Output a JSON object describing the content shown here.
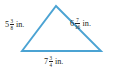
{
  "figure": {
    "type": "triangle-with-side-labels",
    "background_color": "#ffffff",
    "stroke_color": "#4ba3d3",
    "text_color": "#231f20",
    "stroke_width": 1.9,
    "vertices": {
      "apex": {
        "x": 56,
        "y": 6
      },
      "bottom_left": {
        "x": 22,
        "y": 51
      },
      "bottom_right": {
        "x": 101,
        "y": 51
      }
    }
  },
  "labels": {
    "left_side": {
      "name": "left-side-length",
      "whole": "5",
      "numerator": "3",
      "denominator": "8",
      "unit": "in.",
      "full_text": "5 3/8 in."
    },
    "right_side": {
      "name": "right-side-length",
      "whole": "6",
      "numerator": "7",
      "denominator": "16",
      "unit": "in.",
      "full_text": "6 7/16 in."
    },
    "bottom_side": {
      "name": "bottom-side-length",
      "whole": "7",
      "numerator": "3",
      "denominator": "4",
      "unit": "in.",
      "full_text": "7 3/4 in."
    }
  }
}
